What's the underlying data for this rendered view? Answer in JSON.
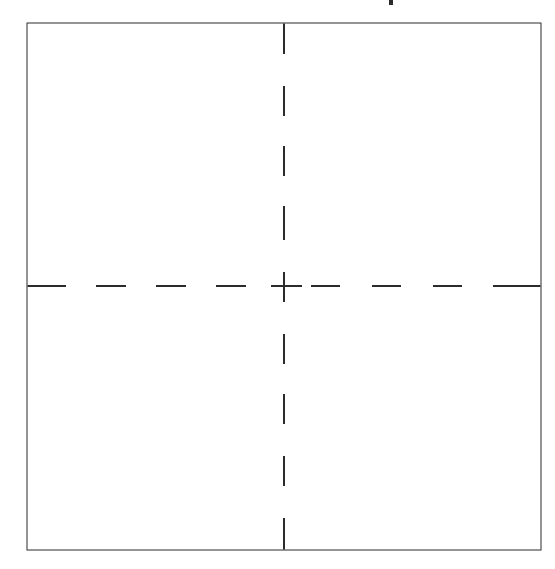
{
  "diagram": {
    "stroke_color": "#2b2b2b",
    "background_color": "#ffffff",
    "frame": {
      "style": "solid"
    },
    "center_lines": {
      "style": "dashed",
      "horizontal": true,
      "vertical": true,
      "crosshair_at_center": true
    },
    "quadrants": [
      {
        "id": "top-left",
        "label": ""
      },
      {
        "id": "top-right",
        "label": ""
      },
      {
        "id": "bottom-left",
        "label": ""
      },
      {
        "id": "bottom-right",
        "label": ""
      }
    ],
    "title_fragment": {
      "text": "",
      "note": "cropped glyph tail visible at top edge"
    }
  }
}
